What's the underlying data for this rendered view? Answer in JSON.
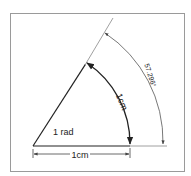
{
  "diagram": {
    "angle_label": "1 rad",
    "arc_length_label": "1cm",
    "radius_label": "1cm",
    "degree_label": "57.296°",
    "angle_radians": 1,
    "angle_degrees": 57.296,
    "colors": {
      "line": "#222222",
      "thin_line": "#777777",
      "frame": "#9a9a9a"
    }
  }
}
